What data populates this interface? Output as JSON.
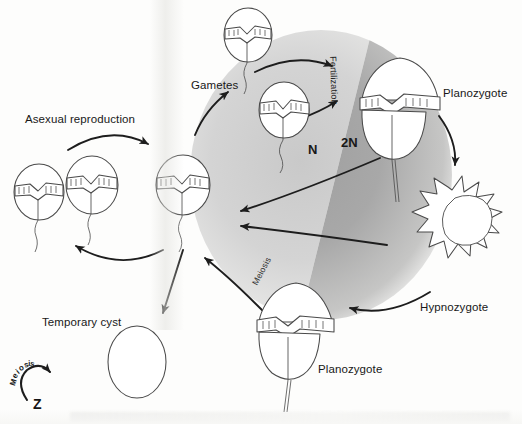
{
  "diagram": {
    "type": "life-cycle-diagram",
    "background_color": "#ffffff",
    "line_color": "#2b2b2b",
    "zones": [
      {
        "name": "haploid",
        "label": "N",
        "fill_light": "#d8d8d8",
        "side": "left"
      },
      {
        "name": "diploid",
        "label": "2N",
        "fill_dark": "#a9a9a9",
        "side": "right"
      }
    ]
  },
  "labels": {
    "asexual_reproduction": "Asexual reproduction",
    "gametes": "Gametes",
    "fertilization": "Fertilization",
    "ploidy_haploid": "N",
    "ploidy_diploid": "2N",
    "planozygote_top": "Planozygote",
    "planozygote_bottom": "Planozygote",
    "hypnozygote": "Hypnozygote",
    "meiosis_arc": "Meiosis",
    "temporary_cyst": "Temporary cyst",
    "legend_meiosis": "Meiosis",
    "legend_z": "Z"
  },
  "stages": [
    {
      "id": "vegetative-cell-1",
      "name": "Vegetative cell",
      "shape": "armoured-dinoflagellate",
      "ploidy": "N"
    },
    {
      "id": "vegetative-cell-2",
      "name": "Vegetative cell",
      "shape": "armoured-dinoflagellate",
      "ploidy": "N"
    },
    {
      "id": "vegetative-cell-3",
      "name": "Vegetative cell",
      "shape": "armoured-dinoflagellate",
      "ploidy": "N"
    },
    {
      "id": "gamete-1",
      "name": "Gamete",
      "shape": "armoured-dinoflagellate",
      "ploidy": "N"
    },
    {
      "id": "gamete-2",
      "name": "Gamete",
      "shape": "armoured-dinoflagellate",
      "ploidy": "N"
    },
    {
      "id": "planozygote-top",
      "name": "Planozygote",
      "shape": "conical-dinoflagellate-biflagellate",
      "ploidy": "2N"
    },
    {
      "id": "hypnozygote",
      "name": "Hypnozygote",
      "shape": "spiny-resting-cyst",
      "ploidy": "2N"
    },
    {
      "id": "planozygote-bottom",
      "name": "Planozygote",
      "shape": "conical-dinoflagellate-biflagellate",
      "ploidy": "2N"
    },
    {
      "id": "temporary-cyst",
      "name": "Temporary cyst",
      "shape": "plain-oval",
      "ploidy": "N"
    }
  ],
  "arrows": [
    {
      "id": "arrow-asexual",
      "from": "vegetative-cell-3",
      "to": "vegetative-cell-2",
      "label": "Asexual reproduction"
    },
    {
      "id": "arrow-to-gametes",
      "from": "vegetative-cell-3",
      "to": "gamete-1",
      "label": "Gametes"
    },
    {
      "id": "arrow-fertilization-upper",
      "from": "gamete-1",
      "to": "planozygote-top",
      "label": "Fertilization"
    },
    {
      "id": "arrow-fertilization-lower",
      "from": "gamete-2",
      "to": "planozygote-top",
      "label": "Fertilization"
    },
    {
      "id": "arrow-planozygote-to-hypnozygote",
      "from": "planozygote-top",
      "to": "hypnozygote",
      "label": ""
    },
    {
      "id": "arrow-hypnozygote-to-planozygote",
      "from": "hypnozygote",
      "to": "planozygote-bottom",
      "label": ""
    },
    {
      "id": "arrow-meiosis-upper",
      "from": "planozygote-top",
      "to": "vegetative-cell-3",
      "label": "Meiosis"
    },
    {
      "id": "arrow-meiosis-lower",
      "from": "hypnozygote",
      "to": "vegetative-cell-3",
      "label": "Meiosis"
    },
    {
      "id": "arrow-planozygote-bottom-to-cell",
      "from": "planozygote-bottom",
      "to": "vegetative-cell-3",
      "label": "Meiosis"
    },
    {
      "id": "arrow-to-temporary-cyst",
      "from": "vegetative-cell-3",
      "to": "temporary-cyst",
      "label": ""
    }
  ],
  "legend": {
    "arc_label": "Meiosis",
    "marker": "Z",
    "description": "Curved arrow marking the meiotic step"
  }
}
